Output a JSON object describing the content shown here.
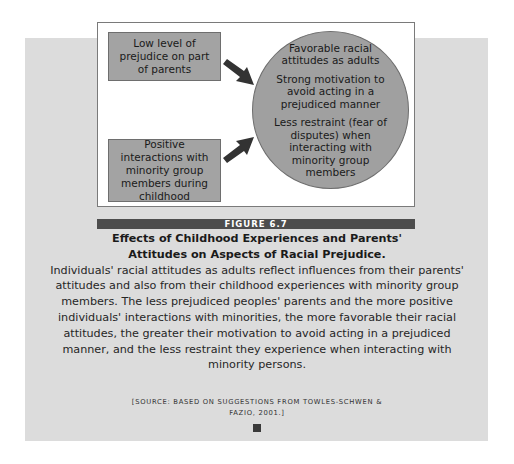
{
  "figure": {
    "label": "FIGURE 6.7",
    "diagram": {
      "causes": [
        {
          "text": "Low level of prejudice on part of parents"
        },
        {
          "text": "Positive interactions with minority group members during childhood"
        }
      ],
      "outcomes": [
        {
          "text": "Favorable racial attitudes as adults"
        },
        {
          "text": "Strong motivation to avoid acting in a prejudiced manner"
        },
        {
          "text": "Less restraint (fear of disputes) when interacting with minority group members"
        }
      ],
      "arrows": [
        {
          "from": "cause-0",
          "to": "outcome-circle",
          "direction": "down-right"
        },
        {
          "from": "cause-1",
          "to": "outcome-circle",
          "direction": "up-right"
        }
      ]
    },
    "caption": {
      "title": "Effects of Childhood Experiences and Parents' Attitudes on Aspects of Racial Prejudice.",
      "body": "Individuals' racial attitudes as adults reflect influences from their parents' attitudes and also from their childhood experiences with minority group members. The less prejudiced peoples' parents and the more positive individuals' interactions with minorities, the more favorable their racial attitudes, the greater their motivation to avoid acting in a prejudiced manner, and the less restraint they experience when interacting with minority persons."
    },
    "source": "[SOURCE: BASED ON SUGGESTIONS FROM TOWLES-SCHWEN & FAZIO, 2001.]"
  },
  "colors": {
    "panel_background": "#dcdcdc",
    "box_fill": "#a3a3a3",
    "circle_fill": "#a0a0a0",
    "arrow": "#333333",
    "banner": "#4d4d4d"
  }
}
